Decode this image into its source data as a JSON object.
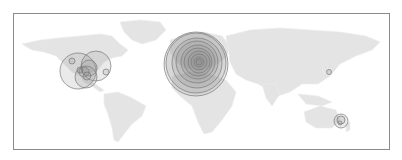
{
  "map": {
    "frame": {
      "x": 13,
      "y": 13,
      "w": 377,
      "h": 137,
      "stroke": "#8a8a8a"
    },
    "land_color": "#e4e4e4",
    "circle_stroke": "#7a7a7a",
    "circle_fill": "rgba(140,140,140,0.18)",
    "landmasses": [
      {
        "name": "north-america",
        "d": "M22 44 L40 40 L58 38 L80 36 L100 34 L112 36 L120 44 L128 50 L122 56 L112 58 L104 62 L98 70 L88 74 L80 76 L72 72 L64 64 L56 56 L44 52 L32 50 Z"
      },
      {
        "name": "greenland",
        "d": "M120 22 L140 20 L160 22 L166 30 L156 40 L142 44 L132 40 L124 32 Z"
      },
      {
        "name": "central-america",
        "d": "M80 76 L90 80 L98 86 L104 90 L100 92 L92 86 L84 82 Z"
      },
      {
        "name": "south-america",
        "d": "M104 94 L118 92 L132 98 L146 106 L142 116 L132 124 L124 134 L118 142 L114 140 L112 128 L108 114 L104 104 Z"
      },
      {
        "name": "europe",
        "d": "M170 40 L186 34 L204 32 L222 36 L230 46 L226 58 L214 66 L200 70 L186 68 L176 62 L170 52 Z"
      },
      {
        "name": "africa",
        "d": "M172 76 L190 72 L210 74 L226 80 L236 92 L232 106 L222 120 L212 132 L204 134 L198 122 L192 106 L180 96 L172 88 Z"
      },
      {
        "name": "asia",
        "d": "M226 36 L250 30 L280 28 L310 30 L340 32 L366 36 L380 42 L372 50 L356 56 L340 64 L330 76 L318 84 L302 84 L290 92 L278 96 L268 90 L258 84 L246 80 L236 74 L230 62 L228 48 Z"
      },
      {
        "name": "india",
        "d": "M262 84 L276 84 L280 94 L272 106 L266 98 Z"
      },
      {
        "name": "southeast-asia-islands",
        "d": "M298 94 L318 96 L332 102 L322 106 L306 104 Z"
      },
      {
        "name": "australia",
        "d": "M304 112 L320 106 L336 110 L340 120 L332 128 L316 128 L306 122 Z"
      },
      {
        "name": "new-zealand",
        "d": "M346 124 L350 122 L350 130 L346 132 Z"
      },
      {
        "name": "japan",
        "d": "M322 66 L326 62 L328 70 L324 74 Z"
      }
    ],
    "clusters": [
      {
        "name": "europe-cluster",
        "circles": [
          {
            "cx": 196,
            "cy": 64,
            "r": 32
          },
          {
            "cx": 196,
            "cy": 63,
            "r": 30
          },
          {
            "cx": 197,
            "cy": 63,
            "r": 25
          },
          {
            "cx": 197,
            "cy": 62,
            "r": 21
          },
          {
            "cx": 198,
            "cy": 62,
            "r": 17
          },
          {
            "cx": 198,
            "cy": 62,
            "r": 14
          },
          {
            "cx": 199,
            "cy": 62,
            "r": 11
          },
          {
            "cx": 199,
            "cy": 62,
            "r": 8
          },
          {
            "cx": 199,
            "cy": 62,
            "r": 5
          },
          {
            "cx": 199,
            "cy": 62,
            "r": 3
          }
        ]
      },
      {
        "name": "north-america-cluster",
        "circles": [
          {
            "cx": 78,
            "cy": 71,
            "r": 18
          },
          {
            "cx": 96,
            "cy": 66,
            "r": 15
          },
          {
            "cx": 86,
            "cy": 77,
            "r": 11
          },
          {
            "cx": 89,
            "cy": 68,
            "r": 8
          },
          {
            "cx": 84,
            "cy": 72,
            "r": 5
          },
          {
            "cx": 87,
            "cy": 76,
            "r": 4
          },
          {
            "cx": 72,
            "cy": 61,
            "r": 3
          },
          {
            "cx": 106,
            "cy": 72,
            "r": 3
          },
          {
            "cx": 80,
            "cy": 70,
            "r": 3
          }
        ]
      },
      {
        "name": "japan-marker",
        "circles": [
          {
            "cx": 329,
            "cy": 72,
            "r": 2.5
          }
        ]
      },
      {
        "name": "new-zealand-cluster",
        "circles": [
          {
            "cx": 341,
            "cy": 121,
            "r": 7
          },
          {
            "cx": 341,
            "cy": 120,
            "r": 4
          },
          {
            "cx": 340,
            "cy": 123,
            "r": 2
          }
        ]
      }
    ]
  }
}
